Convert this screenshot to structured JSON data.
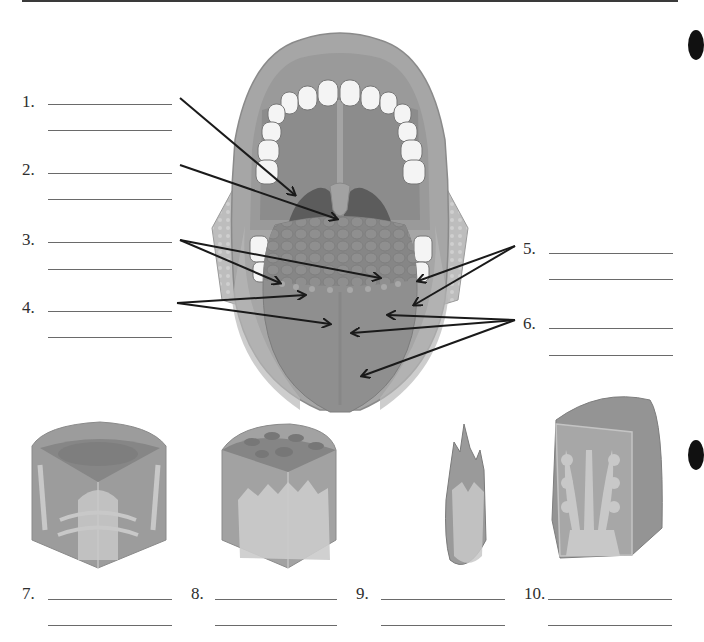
{
  "worksheet": {
    "topic": "Tongue and papillae labeling diagram",
    "labels": [
      {
        "number": "1.",
        "answer_lines": 2
      },
      {
        "number": "2.",
        "answer_lines": 2
      },
      {
        "number": "3.",
        "answer_lines": 2
      },
      {
        "number": "4.",
        "answer_lines": 2
      },
      {
        "number": "5.",
        "answer_lines": 2
      },
      {
        "number": "6.",
        "answer_lines": 2
      },
      {
        "number": "7.",
        "answer_lines": 2
      },
      {
        "number": "8.",
        "answer_lines": 2
      },
      {
        "number": "9.",
        "answer_lines": 2
      },
      {
        "number": "10.",
        "answer_lines": 2
      }
    ],
    "illustrations": {
      "main": "open-mouth-tongue-diagram",
      "papillae": [
        "papilla-illustration-7",
        "papilla-illustration-8",
        "papilla-illustration-9",
        "papilla-illustration-10"
      ]
    },
    "colors": {
      "ink": "#2e2e2e",
      "rule": "#6a6a6a",
      "tissue_light": "#b4b4b4",
      "tissue_mid": "#9c9c9c",
      "tissue_dark": "#858585",
      "tooth": "#f4f4f4"
    }
  }
}
